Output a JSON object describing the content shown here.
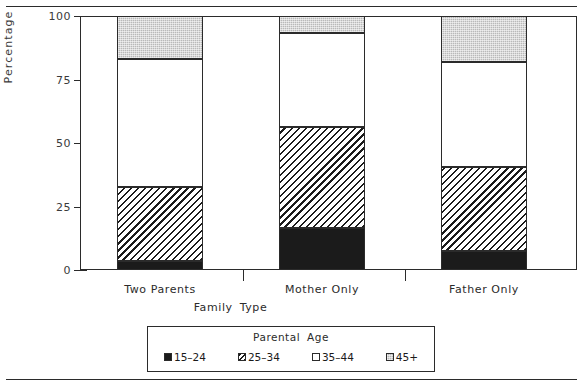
{
  "chart_data": {
    "type": "bar",
    "subtype": "stacked-100-percent",
    "title": "",
    "xlabel": "Family  Type",
    "ylabel": "Percentage",
    "ylim": [
      0,
      100
    ],
    "yticks": [
      0,
      25,
      50,
      75,
      100
    ],
    "ytick_labels": [
      "0",
      "25",
      "50",
      "75",
      "100"
    ],
    "grid": false,
    "legend_title": "Parental   Age",
    "legend_position": "bottom",
    "categories": [
      "Two  Parents",
      "Mother  Only",
      "Father  Only"
    ],
    "series": [
      {
        "name": "15–24",
        "values": [
          3.5,
          16.5,
          7.5
        ],
        "fill": "solid-black",
        "color": "#1b1b1b"
      },
      {
        "name": "25–34",
        "values": [
          29.2,
          39.8,
          33.1
        ],
        "fill": "diagonal-hatch",
        "color": "#ffffff"
      },
      {
        "name": "35–44",
        "values": [
          50.3,
          37.0,
          41.4
        ],
        "fill": "solid-white",
        "color": "#ffffff"
      },
      {
        "name": "45+",
        "values": [
          17.0,
          6.7,
          18.0
        ],
        "fill": "dotted-gray",
        "color": "#b4b4b4"
      }
    ],
    "cumulative_tops": [
      [
        3.5,
        32.7,
        83.0,
        100.0
      ],
      [
        16.5,
        56.3,
        93.3,
        100.0
      ],
      [
        7.5,
        40.6,
        82.0,
        100.0
      ]
    ]
  },
  "axes": {
    "y_title": "Percentage",
    "x_title_part1": "Family",
    "x_title_part2": "Type"
  },
  "legend": {
    "title_part1": "Parental",
    "title_part2": "Age",
    "items": [
      {
        "label": "15–24",
        "swatch": "swatch-black"
      },
      {
        "label": "25–34",
        "swatch": "swatch-hatch"
      },
      {
        "label": "35–44",
        "swatch": "swatch-white"
      },
      {
        "label": "45+",
        "swatch": "swatch-gray"
      }
    ]
  },
  "colors": {
    "ink": "#2b2b2b",
    "black_fill": "#1b1b1b",
    "gray_fill": "#b4b4b4",
    "white_fill": "#ffffff"
  }
}
